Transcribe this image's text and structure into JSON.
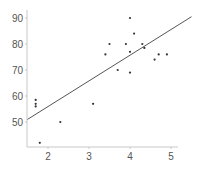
{
  "chart_data": {
    "type": "scatter",
    "title": "",
    "xlabel": "",
    "ylabel": "",
    "xlim": [
      1.5,
      5.5
    ],
    "ylim": [
      40,
      93
    ],
    "xticks": [
      2,
      3,
      4,
      5
    ],
    "yticks": [
      50,
      60,
      70,
      80,
      90
    ],
    "grid": false,
    "legend": null,
    "series": [
      {
        "name": "points",
        "points": [
          {
            "x": 1.7,
            "y": 58.5
          },
          {
            "x": 1.7,
            "y": 57
          },
          {
            "x": 1.7,
            "y": 56
          },
          {
            "x": 1.8,
            "y": 42
          },
          {
            "x": 2.3,
            "y": 50
          },
          {
            "x": 3.1,
            "y": 57
          },
          {
            "x": 3.4,
            "y": 76
          },
          {
            "x": 3.5,
            "y": 80
          },
          {
            "x": 3.7,
            "y": 70
          },
          {
            "x": 3.9,
            "y": 80
          },
          {
            "x": 4.0,
            "y": 90
          },
          {
            "x": 4.0,
            "y": 77
          },
          {
            "x": 4.0,
            "y": 69
          },
          {
            "x": 4.1,
            "y": 84
          },
          {
            "x": 4.3,
            "y": 80
          },
          {
            "x": 4.35,
            "y": 78.5
          },
          {
            "x": 4.6,
            "y": 74
          },
          {
            "x": 4.7,
            "y": 76
          },
          {
            "x": 4.9,
            "y": 76
          }
        ]
      }
    ],
    "trendline": {
      "x0": 1.5,
      "y0": 51,
      "x1": 5.5,
      "y1": 90.5
    }
  },
  "colors": {
    "axis": "#c8c8c8",
    "point": "#333333",
    "line": "#555555",
    "text": "#555555"
  }
}
